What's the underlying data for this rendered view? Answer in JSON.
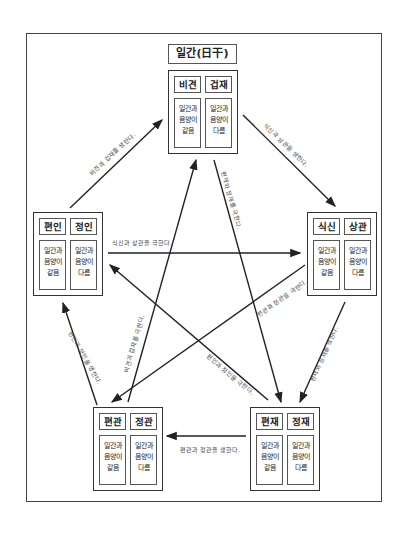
{
  "diagram": {
    "title": "일간(日干)",
    "nodes": [
      {
        "id": "top",
        "left": {
          "name": "비견",
          "desc": "일간과\n음양이\n같음"
        },
        "right": {
          "name": "겁재",
          "desc": "일간과\n음양이\n다름"
        }
      },
      {
        "id": "right",
        "left": {
          "name": "식신",
          "desc": "일간과\n음양이\n같음"
        },
        "right": {
          "name": "상관",
          "desc": "일간과\n음양이\n다름"
        }
      },
      {
        "id": "bottom_right",
        "left": {
          "name": "편재",
          "desc": "일간과\n음양이\n같음"
        },
        "right": {
          "name": "정재",
          "desc": "일간과\n음양이\n다름"
        }
      },
      {
        "id": "bottom_left",
        "left": {
          "name": "편관",
          "desc": "일간과\n음양이\n같음"
        },
        "right": {
          "name": "정관",
          "desc": "일간과\n음양이\n다름"
        }
      },
      {
        "id": "left",
        "left": {
          "name": "편인",
          "desc": "일간과\n음양이\n같음"
        },
        "right": {
          "name": "정인",
          "desc": "일간과\n음양이\n다름"
        }
      }
    ],
    "arrows": {
      "left_to_top": "비견과 겁재를 생한다.",
      "top_to_right": "식신과 상관을 생한다.",
      "right_to_bottom_right": "편재와 정재를 생한다.",
      "bottom_right_to_bottom_left": "편관과 정관을 생한다.",
      "bottom_left_to_left": "편인과 정인을 생한다.",
      "left_to_right": "식신과 상관을 극한다.",
      "top_to_bottom_right": "편재와 정재를 극한다.",
      "right_to_bottom_left": "편관과 정관을 극한다.",
      "bottom_right_to_left": "편인과 정인을 극한다.",
      "bottom_left_to_top": "비견과 겁재를 극한다."
    }
  }
}
